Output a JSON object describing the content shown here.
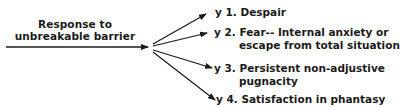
{
  "source": {
    "line1": "Response to",
    "line2": "unbreakable barrier"
  },
  "outcomes": [
    {
      "marker": "y 1.",
      "line1": "Despair",
      "line2": ""
    },
    {
      "marker": "y 2.",
      "line1": "Fear-- Internal anxiety or",
      "line2": "escape from total situation"
    },
    {
      "marker": "y 3.",
      "line1": "Persistent non-adjustive",
      "line2": "pugnacity"
    },
    {
      "marker": "y 4.",
      "line1": "Satisfaction in phantasy",
      "line2": ""
    }
  ],
  "colors": {
    "ink": "#1a1a1a",
    "background": "#ffffff"
  }
}
